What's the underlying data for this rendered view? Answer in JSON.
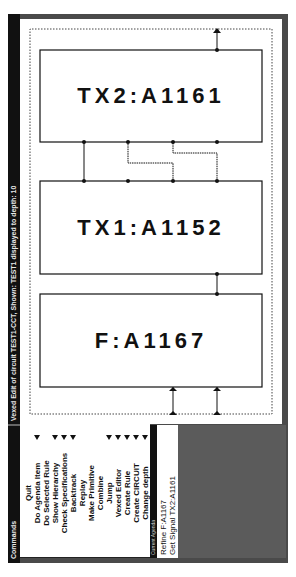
{
  "window": {
    "commands_title": "Commands",
    "title": "Vexed Edit of circuit TEST1-CCT, Shown: TEST1 displayed to depth: 10"
  },
  "commands": [
    {
      "label": "Quit",
      "marker": false
    },
    {
      "label": "Do Agenda Item",
      "marker": true
    },
    {
      "label": "Do Selected Rule",
      "marker": false
    },
    {
      "label": "Show Hierarchy",
      "marker": true
    },
    {
      "label": "Check Specifications",
      "marker": true
    },
    {
      "label": "Backtrack",
      "marker": true
    },
    {
      "label": "Replay",
      "marker": false
    },
    {
      "label": "Make Primitive",
      "marker": false
    },
    {
      "label": "Combine",
      "marker": false
    },
    {
      "label": "Jump",
      "marker": true
    },
    {
      "label": "Vexed Editor",
      "marker": true
    },
    {
      "label": "Create Rule",
      "marker": true
    },
    {
      "label": "Create CIRCUIT",
      "marker": true
    },
    {
      "label": "Change depth",
      "marker": true
    }
  ],
  "agenda": {
    "title": "Current Agenda",
    "items": [
      "Refine F:A1167",
      "Get Signal TX2:A1161"
    ]
  },
  "circuit": {
    "modules": [
      {
        "id": "f",
        "label": "F:A1167"
      },
      {
        "id": "tx1",
        "label": "TX1:A1152"
      },
      {
        "id": "tx2",
        "label": "TX2:A1161"
      }
    ]
  },
  "colors": {
    "titlebar": "#111111",
    "frame": "#4a4a4a",
    "gray_area": "#5b5b5b",
    "ink": "#111111"
  }
}
